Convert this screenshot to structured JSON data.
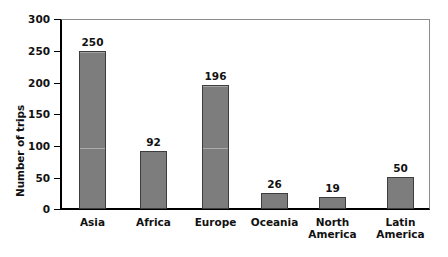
{
  "chart_data": {
    "type": "bar",
    "title": "",
    "xlabel": "",
    "ylabel": "Number of trips",
    "ylim": [
      0,
      300
    ],
    "ytick_labels": [
      "300",
      "250",
      "200",
      "150",
      "100",
      "50",
      "0"
    ],
    "yticks": [
      300,
      250,
      200,
      150,
      100,
      50,
      0
    ],
    "grid": false,
    "legend": "none",
    "categories": [
      "Asia",
      "Africa",
      "Europe",
      "Oceania",
      "North\nAmerica",
      "Latin\nAmerica"
    ],
    "values": [
      250,
      92,
      196,
      26,
      19,
      50
    ],
    "value_labels": [
      "250",
      "92",
      "196",
      "26",
      "19",
      "50"
    ],
    "bars": [
      {
        "category": "Asia",
        "value": 250,
        "label": "250",
        "x": 79,
        "width": 27,
        "scanline": true
      },
      {
        "category": "Africa",
        "value": 92,
        "label": "92",
        "x": 140,
        "width": 27,
        "scanline": false
      },
      {
        "category": "Europe",
        "value": 196,
        "label": "196",
        "x": 202,
        "width": 27,
        "scanline": true
      },
      {
        "category": "Oceania",
        "value": 26,
        "label": "26",
        "x": 261,
        "width": 27,
        "scanline": false
      },
      {
        "category": "North America",
        "value": 19,
        "label": "19",
        "x": 319,
        "width": 27,
        "scanline": false
      },
      {
        "category": "Latin America",
        "value": 50,
        "label": "50",
        "x": 387,
        "width": 27,
        "scanline": false
      }
    ],
    "colors": {
      "bar_fill": "#7d7d7d",
      "bar_stroke": "#3d3d3d",
      "axis": "#000000",
      "frame_light": "#8c8c8c",
      "text": "#111111",
      "background": "#ffffff"
    }
  }
}
